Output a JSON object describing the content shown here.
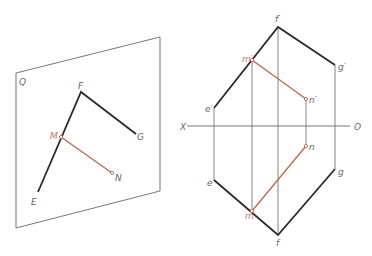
{
  "colors": {
    "object_line": "#2a2a2a",
    "thin_line": "#777777",
    "highlight_line": "#c0654a",
    "label": "#666666",
    "label_highlight": "#c8765e",
    "background": "#ffffff"
  },
  "pictorial": {
    "plane_label": "Q",
    "labels": {
      "F": "F",
      "G": "G",
      "E": "E",
      "M": "M",
      "N": "N"
    }
  },
  "projection": {
    "axis_left_label": "X",
    "axis_right_label": "O",
    "labels": {
      "f_prime": "f′",
      "g_prime": "g′",
      "e_prime": "e′",
      "m_prime": "m′",
      "n_prime": "n′",
      "f": "f",
      "g": "g",
      "e": "e",
      "m": "m",
      "n": "n"
    }
  }
}
